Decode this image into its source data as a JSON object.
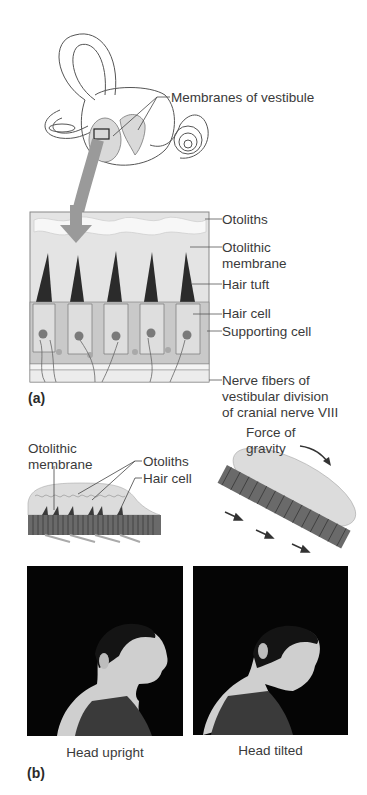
{
  "figure": {
    "panel_a": {
      "label": "(a)",
      "inner_ear_callout": "Membranes of vestibule",
      "detail_labels": {
        "otoliths": "Otoliths",
        "otolithic_membrane_l1": "Otolithic",
        "otolithic_membrane_l2": "membrane",
        "hair_tuft": "Hair tuft",
        "hair_cell": "Hair cell",
        "supporting_cell": "Supporting cell",
        "nerve_l1": "Nerve fibers of",
        "nerve_l2": "vestibular division",
        "nerve_l3": "of cranial nerve VIII"
      }
    },
    "panel_b": {
      "label": "(b)",
      "upright_labels": {
        "otolithic_membrane_l1": "Otolithic",
        "otolithic_membrane_l2": "membrane",
        "otoliths": "Otoliths",
        "hair_cell": "Hair cell"
      },
      "tilted_labels": {
        "force_l1": "Force of",
        "force_l2": "gravity"
      },
      "photos": [
        {
          "caption": "Head upright"
        },
        {
          "caption": "Head tilted"
        }
      ]
    },
    "colors": {
      "membrane_gray": "#d9d9d9",
      "hair_tuft": "#2b2b2b",
      "arrow_gray": "#9a9a9a",
      "cell_gray": "#bdbdbd",
      "nucleus": "#7a7a7a",
      "photo_bg": "#050505"
    }
  }
}
